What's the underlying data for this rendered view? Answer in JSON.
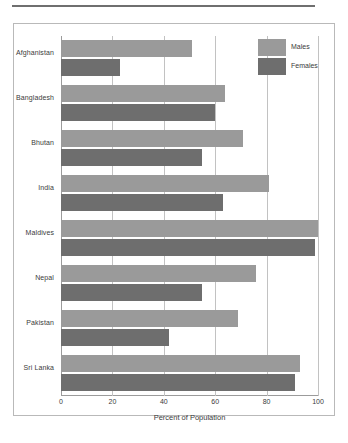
{
  "chart_data": {
    "type": "bar",
    "orientation": "horizontal",
    "title": "",
    "xlabel": "Percent of Population",
    "ylabel": "",
    "xlim": [
      0,
      100
    ],
    "xticks": [
      0,
      20,
      40,
      60,
      80,
      100
    ],
    "grid": true,
    "legend_position": "top-right",
    "categories": [
      "Afghanistan",
      "Bangladesh",
      "Bhutan",
      "India",
      "Maldives",
      "Nepal",
      "Pakistan",
      "Sri Lanka"
    ],
    "series": [
      {
        "name": "Males",
        "color": "#9a9a9a",
        "values": [
          51,
          64,
          71,
          81,
          100,
          76,
          69,
          93
        ]
      },
      {
        "name": "Females",
        "color": "#6e6e6e",
        "values": [
          23,
          60,
          55,
          63,
          99,
          55,
          42,
          91
        ]
      }
    ]
  },
  "legend": {
    "items": [
      {
        "label": "Males"
      },
      {
        "label": "Females"
      }
    ]
  }
}
